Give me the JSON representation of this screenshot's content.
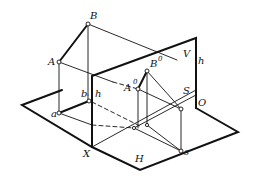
{
  "diagram": {
    "type": "descriptive-geometry projection",
    "planes": {
      "vertical": "V",
      "horizontal": "H"
    },
    "axis_labels": {
      "x": "X",
      "origin": "O"
    },
    "points": {
      "A": "A",
      "B": "B",
      "A0": "A",
      "A0_sup": "0",
      "B0": "B",
      "B0_sup": "0",
      "S": "S",
      "a": "a",
      "b": "b",
      "s": "s",
      "h_left": "h",
      "h_right": "h"
    },
    "colors": {
      "line": "#111111",
      "background": "#ffffff"
    }
  }
}
